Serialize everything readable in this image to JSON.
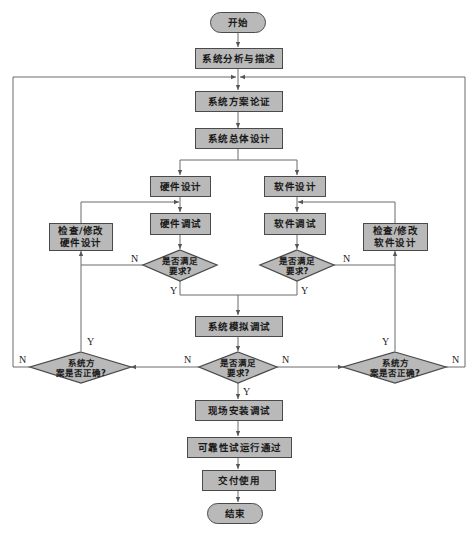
{
  "diagram": {
    "type": "flowchart",
    "colors": {
      "node_fill": "#b9b9b9",
      "node_border": "#4a4a4a",
      "line": "#6a6a6a",
      "background": "#ffffff"
    },
    "nodes": {
      "start": "开始",
      "analysis": "系统分析与描述",
      "scheme_verify": "系统方案论证",
      "overall_design": "系统总体设计",
      "hw_design": "硬件设计",
      "sw_design": "软件设计",
      "hw_debug": "硬件调试",
      "sw_debug": "软件调试",
      "hw_fix": "检查/修改\n硬件设计",
      "sw_fix": "检查/修改\n软件设计",
      "hw_check": "是否满足\n要求?",
      "sw_check": "是否满足\n要求?",
      "sim_debug": "系统模拟调试",
      "sys_check": "是否满足\n要求?",
      "scheme_ok_left": "系统方\n案是否正确?",
      "scheme_ok_right": "系统方\n案是否正确?",
      "onsite": "现场安装调试",
      "reliability": "可靠性试运行通过",
      "delivery": "交付使用",
      "end": "结束"
    },
    "labels": {
      "yes": "Y",
      "no": "N"
    },
    "edges": [
      {
        "from": "start",
        "to": "analysis"
      },
      {
        "from": "analysis",
        "to": "scheme_verify"
      },
      {
        "from": "scheme_verify",
        "to": "overall_design"
      },
      {
        "from": "overall_design",
        "to": "hw_design"
      },
      {
        "from": "overall_design",
        "to": "sw_design"
      },
      {
        "from": "hw_design",
        "to": "hw_debug"
      },
      {
        "from": "sw_design",
        "to": "sw_debug"
      },
      {
        "from": "hw_debug",
        "to": "hw_check"
      },
      {
        "from": "sw_debug",
        "to": "sw_check"
      },
      {
        "from": "hw_check",
        "to": "hw_fix",
        "label": "N"
      },
      {
        "from": "sw_check",
        "to": "sw_fix",
        "label": "N"
      },
      {
        "from": "hw_fix",
        "to": "hw_debug"
      },
      {
        "from": "sw_fix",
        "to": "sw_debug"
      },
      {
        "from": "hw_check",
        "to": "sim_debug",
        "label": "Y"
      },
      {
        "from": "sw_check",
        "to": "sim_debug",
        "label": "Y"
      },
      {
        "from": "sim_debug",
        "to": "sys_check"
      },
      {
        "from": "sys_check",
        "to": "scheme_ok_left",
        "label": "N"
      },
      {
        "from": "sys_check",
        "to": "scheme_ok_right",
        "label": "N"
      },
      {
        "from": "scheme_ok_left",
        "to": "hw_fix",
        "label": "Y"
      },
      {
        "from": "scheme_ok_right",
        "to": "sw_fix",
        "label": "Y"
      },
      {
        "from": "scheme_ok_left",
        "to": "scheme_verify",
        "label": "N"
      },
      {
        "from": "scheme_ok_right",
        "to": "scheme_verify",
        "label": "N"
      },
      {
        "from": "sys_check",
        "to": "onsite",
        "label": "Y"
      },
      {
        "from": "onsite",
        "to": "reliability"
      },
      {
        "from": "reliability",
        "to": "delivery"
      },
      {
        "from": "delivery",
        "to": "end"
      }
    ]
  }
}
